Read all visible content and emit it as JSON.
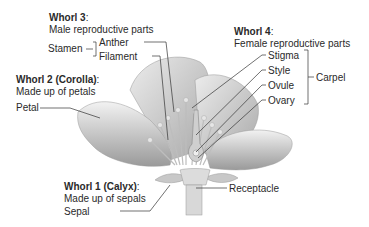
{
  "whorl3": {
    "heading_bold": "Whorl 3",
    "heading_rest": ":",
    "subtitle": "Male reproductive parts",
    "group_label": "Stamen",
    "parts": [
      "Anther",
      "Filament"
    ]
  },
  "whorl4": {
    "heading_bold": "Whorl 4",
    "heading_rest": ":",
    "subtitle": "Female reproductive parts",
    "group_label": "Carpel",
    "parts": [
      "Stigma",
      "Style",
      "Ovule",
      "Ovary"
    ]
  },
  "whorl2": {
    "heading_bold": "Whorl 2 (Corolla)",
    "heading_rest": ":",
    "subtitle": "Made up of petals",
    "part": "Petal"
  },
  "whorl1": {
    "heading_bold": "Whorl 1 (Calyx)",
    "heading_rest": ":",
    "subtitle": "Made up of sepals",
    "part": "Sepal"
  },
  "receptacle": {
    "label": "Receptacle"
  }
}
